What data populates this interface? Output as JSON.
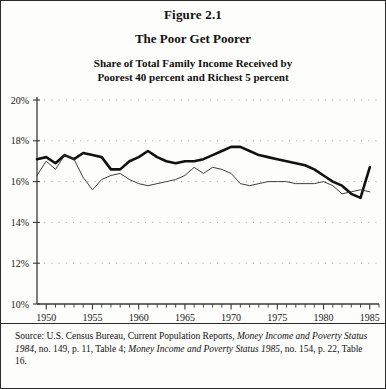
{
  "figure": {
    "number": "Figure 2.1",
    "title": "The Poor Get Poorer",
    "subtitle_line1": "Share of Total Family Income Received by",
    "subtitle_line2": "Poorest 40 percent and Richest 5 percent"
  },
  "source": {
    "prefix": "Source: U.S. Census Bureau, Current Population Reports, ",
    "italic1": "Money Income and Poverty Status 1984",
    "mid": ", no. 149, p. 11, Table 4; ",
    "italic2": "Money Income and Poverty Status 1985",
    "suffix": ", no. 154, p. 22, Table 16."
  },
  "colors": {
    "frame": "#2b2b2b",
    "axis": "#3a3a3a",
    "series_poorest40": "#111111",
    "series_richest5": "#333333",
    "gridline_dots": "#8a8a8a",
    "background": "#fdfdfb"
  },
  "chart_data": {
    "type": "line",
    "title": "The Poor Get Poorer",
    "subtitle": "Share of Total Family Income Received by Poorest 40 percent and Richest 5 percent",
    "xlabel": "",
    "ylabel": "",
    "xlim": [
      1949,
      1986
    ],
    "ylim": [
      10,
      20
    ],
    "ytick_labels": [
      "10%",
      "12%",
      "14%",
      "16%",
      "18%",
      "20%"
    ],
    "ytick_values": [
      10,
      12,
      14,
      16,
      18,
      20
    ],
    "xtick_labels": [
      "1950",
      "1955",
      "1960",
      "1965",
      "1970",
      "1975",
      "1980",
      "1985"
    ],
    "xtick_values": [
      1950,
      1955,
      1960,
      1965,
      1970,
      1975,
      1980,
      1985
    ],
    "minor_xticks_every": 1,
    "grid": "dotted horizontal gridlines at each y tick",
    "legend": "none",
    "x": [
      1949,
      1950,
      1951,
      1952,
      1953,
      1954,
      1955,
      1956,
      1957,
      1958,
      1959,
      1960,
      1961,
      1962,
      1963,
      1964,
      1965,
      1966,
      1967,
      1968,
      1969,
      1970,
      1971,
      1972,
      1973,
      1974,
      1975,
      1976,
      1977,
      1978,
      1979,
      1980,
      1981,
      1982,
      1983,
      1984,
      1985
    ],
    "series": [
      {
        "name": "Richest 5 percent",
        "style": "thick",
        "values": [
          17.1,
          17.2,
          16.9,
          17.3,
          17.1,
          17.4,
          17.3,
          17.2,
          16.6,
          16.6,
          17.0,
          17.2,
          17.5,
          17.2,
          17.0,
          16.9,
          17.0,
          17.0,
          17.1,
          17.3,
          17.5,
          17.7,
          17.7,
          17.5,
          17.3,
          17.2,
          17.1,
          17.0,
          16.9,
          16.8,
          16.6,
          16.3,
          16.0,
          15.8,
          15.4,
          15.2,
          16.7
        ]
      },
      {
        "name": "Poorest 40 percent",
        "style": "thin",
        "values": [
          16.3,
          17.0,
          16.6,
          17.3,
          17.1,
          16.2,
          15.6,
          16.1,
          16.3,
          16.4,
          16.1,
          15.9,
          15.8,
          15.9,
          16.0,
          16.1,
          16.3,
          16.7,
          16.4,
          16.7,
          16.6,
          16.4,
          15.9,
          15.8,
          15.9,
          16.0,
          16.0,
          16.0,
          15.9,
          15.9,
          15.9,
          16.0,
          15.8,
          15.4,
          15.5,
          15.6,
          15.5
        ]
      }
    ]
  }
}
